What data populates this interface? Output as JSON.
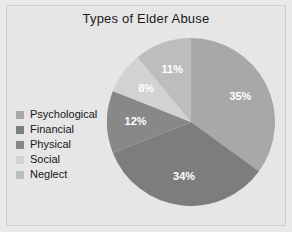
{
  "chart_data": {
    "type": "pie",
    "title": "Types of Elder Abuse",
    "categories": [
      "Psychological",
      "Financial",
      "Physical",
      "Social",
      "Neglect"
    ],
    "values": [
      35,
      34,
      12,
      8,
      11
    ],
    "value_labels": [
      "35%",
      "34%",
      "12%",
      "8%",
      "11%"
    ],
    "colors": [
      "#a8a8a8",
      "#7d7d7d",
      "#888888",
      "#d2d2d2",
      "#bdbdbd"
    ],
    "unit": "%",
    "start_angle_deg": 0,
    "direction": "clockwise",
    "legend_position": "left",
    "grid": false,
    "xlabel": "",
    "ylabel": "",
    "background": "#e6e6e6",
    "label_color": "#ffffff",
    "title_color": "#1a1a1a"
  },
  "legend": {
    "items": [
      {
        "label": "Psychological",
        "color": "#a8a8a8"
      },
      {
        "label": "Financial",
        "color": "#7d7d7d"
      },
      {
        "label": "Physical",
        "color": "#888888"
      },
      {
        "label": "Social",
        "color": "#d2d2d2"
      },
      {
        "label": "Neglect",
        "color": "#bdbdbd"
      }
    ]
  }
}
